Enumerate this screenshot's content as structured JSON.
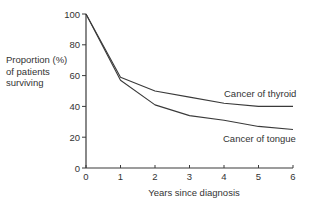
{
  "chart_data": {
    "type": "line",
    "title": "",
    "xlabel": "Years since diagnosis",
    "ylabel": "Proportion (%) of patients surviving",
    "ylabel_lines": [
      "Proportion (%)",
      "of patients",
      "surviving"
    ],
    "x": [
      0,
      1,
      2,
      3,
      4,
      5,
      6
    ],
    "xticks": [
      "0",
      "1",
      "2",
      "3",
      "4",
      "5",
      "6"
    ],
    "yticks": [
      "0",
      "20",
      "40",
      "60",
      "80",
      "100"
    ],
    "xlim": [
      0,
      6
    ],
    "ylim": [
      0,
      100
    ],
    "grid": false,
    "legend": "inline labels at line ends",
    "series": [
      {
        "name": "Cancer of thyroid",
        "values": [
          100,
          59,
          50,
          46,
          42,
          40,
          40
        ]
      },
      {
        "name": "Cancer of tongue",
        "values": [
          100,
          57,
          41,
          34,
          31,
          27,
          25
        ]
      }
    ]
  },
  "labels": {
    "thyroid": "Cancer of thyroid",
    "tongue": "Cancer of tongue"
  },
  "colors": {
    "line": "#3a3a3a",
    "axis": "#3a3a3a",
    "text": "#333333"
  }
}
